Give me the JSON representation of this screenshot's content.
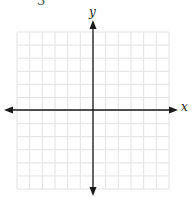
{
  "top_fragment": {
    "text": "3"
  },
  "graph": {
    "x_axis_label": "x",
    "y_axis_label": "y",
    "grid": {
      "columns": 12,
      "rows": 12,
      "left": 17,
      "top": 32,
      "right": 169,
      "bottom": 189,
      "line_color": "#e2e2e2"
    },
    "axes": {
      "color": "#1a1a1a",
      "origin_x": 93,
      "origin_y": 110,
      "x_start": 4,
      "x_end": 178,
      "y_start": 20,
      "y_end": 196
    }
  }
}
